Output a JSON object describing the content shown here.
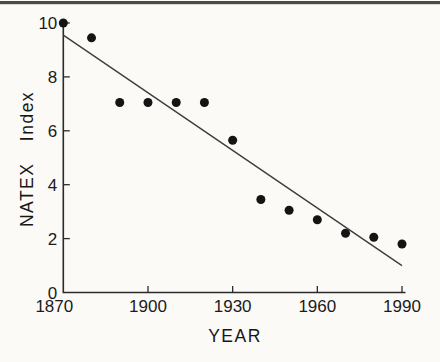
{
  "figure": {
    "background": "#fbfaf7",
    "top_rule_color": "#4a4a4a"
  },
  "chart_data": {
    "type": "scatter",
    "title": "",
    "xlabel": "YEAR",
    "ylabel": "NATEX Index",
    "xlim": [
      1870,
      1990
    ],
    "ylim": [
      0,
      10
    ],
    "x_ticks": [
      1870,
      1900,
      1930,
      1960,
      1990
    ],
    "y_ticks": [
      0,
      2,
      4,
      6,
      8,
      10
    ],
    "grid": false,
    "legend": false,
    "axis_color": "#2b2b2b",
    "series": [
      {
        "name": "NATEX Index observations",
        "type": "scatter",
        "marker": "filled-circle",
        "marker_radius_px": 4.5,
        "color": "#141414",
        "points": [
          {
            "x": 1870,
            "y": 10.0
          },
          {
            "x": 1880,
            "y": 9.45
          },
          {
            "x": 1890,
            "y": 7.05
          },
          {
            "x": 1900,
            "y": 7.05
          },
          {
            "x": 1910,
            "y": 7.05
          },
          {
            "x": 1920,
            "y": 7.05
          },
          {
            "x": 1930,
            "y": 5.65
          },
          {
            "x": 1940,
            "y": 3.45
          },
          {
            "x": 1950,
            "y": 3.05
          },
          {
            "x": 1960,
            "y": 2.7
          },
          {
            "x": 1970,
            "y": 2.2
          },
          {
            "x": 1980,
            "y": 2.05
          },
          {
            "x": 1990,
            "y": 1.8
          }
        ]
      },
      {
        "name": "linear trend line",
        "type": "line",
        "color": "#3d3d3d",
        "points": [
          {
            "x": 1870,
            "y": 9.55
          },
          {
            "x": 1990,
            "y": 1.0
          }
        ]
      }
    ]
  }
}
